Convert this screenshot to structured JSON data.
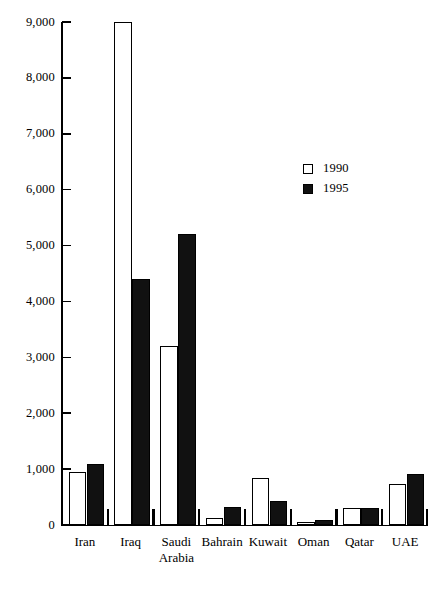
{
  "chart_data": {
    "type": "bar",
    "title": "",
    "subtitle": "",
    "xlabel": "",
    "ylabel": "",
    "ylim": [
      0,
      9000
    ],
    "ytick_values": [
      0,
      1000,
      2000,
      3000,
      4000,
      5000,
      6000,
      7000,
      8000,
      9000
    ],
    "ytick_labels": [
      "0",
      "1,000",
      "2,000",
      "3,000",
      "4,000",
      "5,000",
      "6,000",
      "7,000",
      "8,000",
      "9,000"
    ],
    "grid": false,
    "legend_position": "center-right",
    "categories": [
      "Iran",
      "Iraq",
      "Saudi Arabia",
      "Bahrain",
      "Kuwait",
      "Oman",
      "Qatar",
      "UAE"
    ],
    "category_labels": [
      [
        "Iran"
      ],
      [
        "Iraq"
      ],
      [
        "Saudi",
        "Arabia"
      ],
      [
        "Bahrain"
      ],
      [
        "Kuwait"
      ],
      [
        "Oman"
      ],
      [
        "Qatar"
      ],
      [
        "UAE"
      ]
    ],
    "series": [
      {
        "name": "1990",
        "color": "#ffffff",
        "values": [
          950,
          9000,
          3200,
          130,
          840,
          60,
          300,
          730
        ]
      },
      {
        "name": "1995",
        "color": "#111111",
        "values": [
          1100,
          4400,
          5200,
          320,
          430,
          90,
          310,
          920
        ]
      }
    ]
  },
  "legend": {
    "items": [
      {
        "label": "1990",
        "swatch": "open-square"
      },
      {
        "label": "1995",
        "swatch": "filled-square"
      }
    ]
  }
}
